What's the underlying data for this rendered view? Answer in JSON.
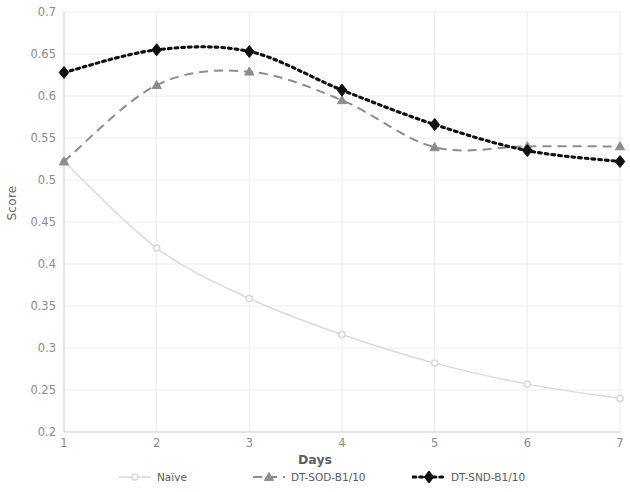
{
  "chart_data": {
    "type": "line",
    "title": "",
    "xlabel": "Days",
    "ylabel": "Score",
    "x": [
      1,
      2,
      3,
      4,
      5,
      6,
      7
    ],
    "categories": [
      "1",
      "2",
      "3",
      "4",
      "5",
      "6",
      "7"
    ],
    "xlim": [
      1,
      7
    ],
    "ylim": [
      0.2,
      0.7
    ],
    "ytick_labels": [
      "0.2",
      "0.25",
      "0.3",
      "0.35",
      "0.4",
      "0.45",
      "0.5",
      "0.55",
      "0.6",
      "0.65",
      "0.7"
    ],
    "ytick_values": [
      0.2,
      0.25,
      0.3,
      0.35,
      0.4,
      0.45,
      0.5,
      0.55,
      0.6,
      0.65,
      0.7
    ],
    "grid": true,
    "legend_position": "bottom",
    "series": [
      {
        "name": "Naïve",
        "values": [
          0.522,
          0.419,
          0.359,
          0.316,
          0.282,
          0.257,
          0.24
        ],
        "color": "#d9d9d9",
        "line_style": "solid",
        "marker": "circle"
      },
      {
        "name": "DT-SOD-B1/10",
        "values": [
          0.522,
          0.613,
          0.629,
          0.595,
          0.539,
          0.54,
          0.54
        ],
        "color": "#8c8c8c",
        "line_style": "dashed",
        "marker": "triangle"
      },
      {
        "name": "DT-SND-B1/10",
        "values": [
          0.628,
          0.655,
          0.653,
          0.607,
          0.566,
          0.535,
          0.522
        ],
        "color": "#101010",
        "line_style": "dotted",
        "marker": "diamond"
      }
    ]
  },
  "axes": {
    "x_label": "Days",
    "y_label": "Score"
  },
  "legend": {
    "items": [
      {
        "label": "Naïve"
      },
      {
        "label": "DT-SOD-B1/10"
      },
      {
        "label": "DT-SND-B1/10"
      }
    ]
  }
}
